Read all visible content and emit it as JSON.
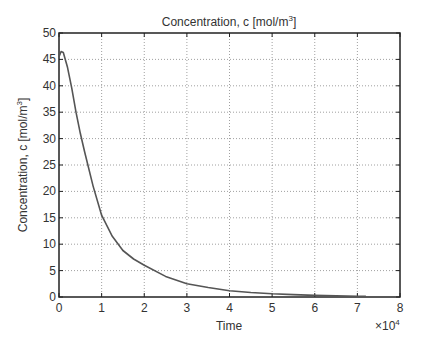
{
  "chart_data": {
    "type": "line",
    "title": "Concentration, c [mol/m",
    "title_sup": "3",
    "title_suffix": "]",
    "xlabel": "Time",
    "ylabel": "Concentration, c [mol/m",
    "ylabel_sup": "3",
    "ylabel_suffix": "]",
    "x_multiplier": "×10",
    "x_multiplier_exp": "4",
    "xlim": [
      0,
      8
    ],
    "ylim": [
      0,
      50
    ],
    "xticks": [
      "0",
      "1",
      "2",
      "3",
      "4",
      "5",
      "6",
      "7",
      "8"
    ],
    "yticks": [
      "0",
      "5",
      "10",
      "15",
      "20",
      "25",
      "30",
      "35",
      "40",
      "45",
      "50"
    ],
    "grid": true,
    "series": [
      {
        "name": "c",
        "color": "#555555",
        "x": [
          0,
          0.05,
          0.1,
          0.2,
          0.3,
          0.4,
          0.5,
          0.6,
          0.8,
          1.0,
          1.25,
          1.5,
          1.75,
          2.0,
          2.5,
          3.0,
          3.5,
          4.0,
          4.5,
          5.0,
          5.5,
          6.0,
          6.5,
          7.0,
          7.2
        ],
        "values": [
          45.5,
          46.5,
          46.3,
          43.5,
          39.5,
          35.0,
          31.0,
          27.5,
          21.0,
          15.5,
          11.5,
          8.8,
          7.2,
          6.0,
          3.9,
          2.5,
          1.8,
          1.2,
          0.85,
          0.6,
          0.45,
          0.3,
          0.22,
          0.15,
          0.13
        ]
      }
    ]
  }
}
